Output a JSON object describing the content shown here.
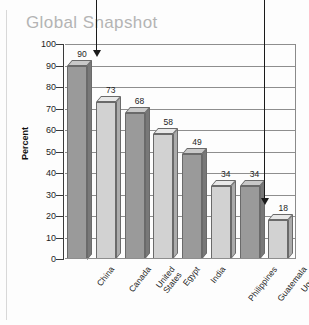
{
  "title": "Global Snapshot",
  "chart_data": {
    "type": "bar",
    "title": "Global Snapshot",
    "xlabel": "",
    "ylabel": "Percent",
    "ylim": [
      0,
      100
    ],
    "ytick_labels": [
      "100",
      "90",
      "80",
      "70",
      "60",
      "50",
      "40",
      "30",
      "20",
      "10",
      "0"
    ],
    "yticks": [
      100,
      90,
      80,
      70,
      60,
      50,
      40,
      30,
      20,
      10,
      0
    ],
    "grid": true,
    "legend": "none",
    "categories": [
      "China",
      "Canada",
      "United\nStates",
      "Egypt",
      "India",
      "Philippines",
      "Guatemala",
      "Uganda"
    ],
    "values": [
      90,
      73,
      68,
      58,
      49,
      34,
      34,
      18
    ],
    "data_labels": [
      "90",
      "73",
      "68",
      "58",
      "49",
      "34",
      "34",
      "18"
    ],
    "annotations": [
      {
        "name": "arrow-to-first-bar",
        "target": "China",
        "direction": "down"
      },
      {
        "name": "arrow-to-last-bar",
        "target": "Uganda",
        "direction": "down"
      }
    ]
  },
  "colors": {
    "title": "#b4b4b4",
    "bar_dark_front": "#9a9a9a",
    "bar_dark_top": "#c8c8c8",
    "bar_dark_side": "#787878",
    "bar_light_front": "#d2d2d2",
    "bar_light_top": "#e8e8e8",
    "bar_light_side": "#ababab",
    "grid": "#8e8e8e",
    "axis": "#3a3a3a",
    "background": "#fdfdfd"
  }
}
